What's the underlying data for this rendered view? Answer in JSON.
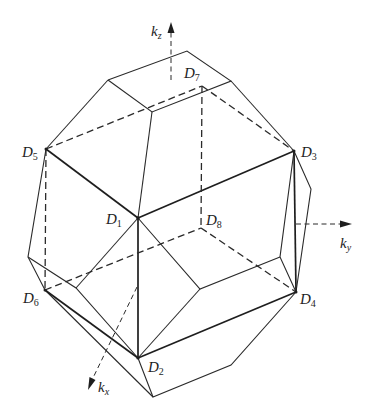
{
  "figure": {
    "axes": [
      {
        "id": "kz",
        "symbol": "k",
        "subscript": "z"
      },
      {
        "id": "ky",
        "symbol": "k",
        "subscript": "y"
      },
      {
        "id": "kx",
        "symbol": "k",
        "subscript": "x"
      }
    ],
    "vertex_labels": [
      {
        "id": "D1",
        "symbol": "D",
        "subscript": "1"
      },
      {
        "id": "D2",
        "symbol": "D",
        "subscript": "2"
      },
      {
        "id": "D3",
        "symbol": "D",
        "subscript": "3"
      },
      {
        "id": "D4",
        "symbol": "D",
        "subscript": "4"
      },
      {
        "id": "D5",
        "symbol": "D",
        "subscript": "5"
      },
      {
        "id": "D6",
        "symbol": "D",
        "subscript": "6"
      },
      {
        "id": "D7",
        "symbol": "D",
        "subscript": "7"
      },
      {
        "id": "D8",
        "symbol": "D",
        "subscript": "8"
      }
    ],
    "colors": {
      "line": "#1e1e1e",
      "background": "#ffffff"
    }
  }
}
